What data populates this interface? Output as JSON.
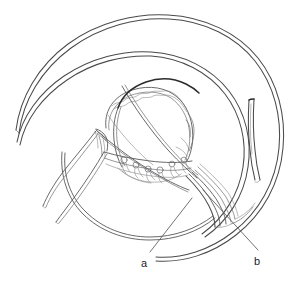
{
  "figure": {
    "kind": "scientific-line-drawing",
    "background_color": "#ffffff",
    "ink_color": "#58585a",
    "dark_ink_color": "#2b2b2d",
    "width": 297,
    "height": 284,
    "labels": [
      {
        "id": "a",
        "text": "a",
        "x": 141,
        "y": 258,
        "leader_from_x": 192,
        "leader_from_y": 198,
        "leader_to_x": 150,
        "leader_to_y": 252
      },
      {
        "id": "b",
        "text": "b",
        "x": 254,
        "y": 256,
        "leader_from_x": 203,
        "leader_from_y": 190,
        "leader_to_x": 258,
        "leader_to_y": 250
      }
    ],
    "parts": [
      {
        "name": "outer-spiral-whorl",
        "note": "outermost doubled contour sweeping from upper left around the right side"
      },
      {
        "name": "second-spiral-whorl",
        "note": "inner parallel doubled contour"
      },
      {
        "name": "inner-coil-loop",
        "note": "central rounded loop with crenulated upper margin"
      },
      {
        "name": "nodule-band",
        "note": "transverse band bearing small circular nodules"
      },
      {
        "name": "filament-bundle",
        "note": "bundle of parallel strands curving to lower right"
      },
      {
        "name": "left-filaments",
        "note": "two slender tapering threads extending to lower left"
      },
      {
        "name": "right-blade",
        "note": "narrow elongated blade-like strip on the right"
      },
      {
        "name": "dark-arc",
        "note": "short dark heavy stroke at top centre"
      }
    ]
  }
}
